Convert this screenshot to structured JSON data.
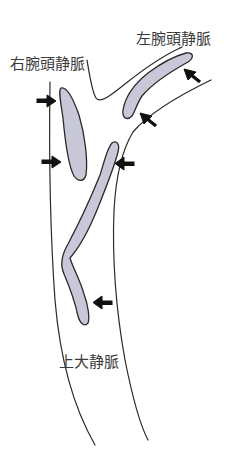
{
  "diagram": {
    "labels": {
      "left_brachiocephalic_vein": "左腕頭静脈",
      "right_brachiocephalic_vein": "右腕頭静脈",
      "superior_vena_cava": "上大静脈"
    },
    "colors": {
      "thrombus_fill": "#c9c8d8",
      "outline": "#2a2a2a",
      "arrow": "#111111",
      "text": "#3a3a3a",
      "background": "#ffffff"
    },
    "arrows": [
      {
        "id": "right-bcv-upper",
        "direction": "right"
      },
      {
        "id": "right-bcv-lower",
        "direction": "right"
      },
      {
        "id": "svc-upper",
        "direction": "left"
      },
      {
        "id": "left-bcv-upper",
        "direction": "up-left"
      },
      {
        "id": "left-bcv-lower",
        "direction": "up-left"
      },
      {
        "id": "svc-lower",
        "direction": "left"
      }
    ],
    "thrombi": [
      {
        "id": "right-bcv-thrombus"
      },
      {
        "id": "left-bcv-thrombus"
      },
      {
        "id": "svc-thrombus"
      }
    ]
  }
}
